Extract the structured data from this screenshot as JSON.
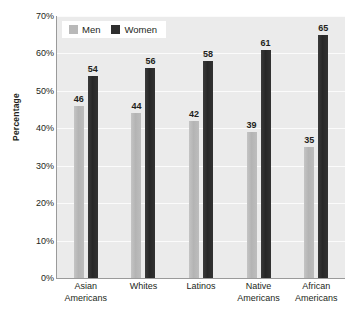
{
  "chart_data": {
    "type": "bar",
    "title": "",
    "subtitle": "",
    "xlabel": "",
    "ylabel": "Percentage",
    "categories": [
      "Asian\nAmericans",
      "Whites",
      "Latinos",
      "Native\nAmericans",
      "African\nAmericans"
    ],
    "category_lines": [
      [
        "Asian",
        "Americans"
      ],
      [
        "Whites",
        ""
      ],
      [
        "Latinos",
        ""
      ],
      [
        "Native",
        "Americans"
      ],
      [
        "African",
        "Americans"
      ]
    ],
    "series": [
      {
        "name": "Men",
        "values": [
          46,
          44,
          42,
          39,
          35
        ],
        "color": "#b9b9b9"
      },
      {
        "name": "Women",
        "values": [
          54,
          56,
          58,
          61,
          65
        ],
        "color": "#2e2e2e"
      }
    ],
    "ylim": [
      0,
      70
    ],
    "ytick_values": [
      0,
      10,
      20,
      30,
      40,
      50,
      60,
      70
    ],
    "ytick_labels": [
      "0%",
      "10%",
      "20%",
      "30%",
      "40%",
      "50%",
      "60%",
      "70%"
    ],
    "grid": true,
    "legend_position": "top-left",
    "plot_background": "#ebebeb",
    "gridline_color": "#fbfbfb",
    "axis_color": "#9a9a9a",
    "data_labels": true
  }
}
